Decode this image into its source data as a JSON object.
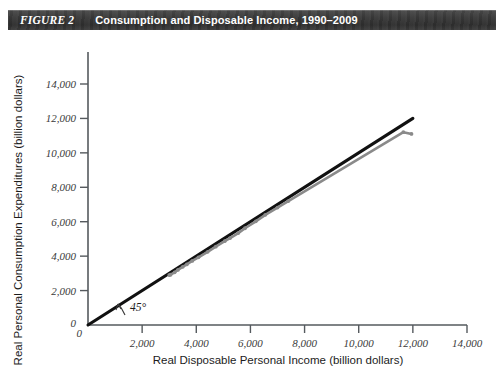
{
  "header": {
    "figure_label": "FIGURE 2",
    "title": "Consumption and Disposable Income, 1990–2009",
    "bar_color": "#343434",
    "text_color": "#ffffff"
  },
  "chart_data": {
    "type": "line",
    "title": "Consumption and Disposable Income, 1990–2009",
    "xlabel": "Real Disposable Personal Income (billion dollars)",
    "ylabel": "Real Personal Consumption Expenditures (billion dollars)",
    "xlim": [
      0,
      14000
    ],
    "ylim": [
      0,
      14000
    ],
    "xticks": [
      0,
      2000,
      4000,
      6000,
      8000,
      10000,
      12000,
      14000
    ],
    "yticks": [
      0,
      2000,
      4000,
      6000,
      8000,
      10000,
      12000,
      14000
    ],
    "xticklabels": [
      "0",
      "2,000",
      "4,000",
      "6,000",
      "8,000",
      "10,000",
      "12,000",
      "14,000"
    ],
    "yticklabels": [
      "0",
      "2,000",
      "4,000",
      "6,000",
      "8,000",
      "10,000",
      "12,000",
      "14,000"
    ],
    "grid": false,
    "legend": "none",
    "annotations": [
      {
        "name": "forty-five-degree-label",
        "text": "45°",
        "x": 1250,
        "y": 700
      }
    ],
    "series": [
      {
        "name": "45-degree reference line",
        "style": "solid-black",
        "color": "#111111",
        "x": [
          0,
          12000
        ],
        "y": [
          0,
          12000
        ],
        "markers": false
      },
      {
        "name": "Consumption vs. Disposable Income",
        "style": "solid-gray-with-markers",
        "color": "#8a8a8a",
        "markers": true,
        "years": [
          1990,
          1991,
          1992,
          1993,
          1994,
          1995,
          1996,
          1997,
          1998,
          1999,
          2000,
          2001,
          2002,
          2003,
          2004,
          2005,
          2006,
          2007,
          2008,
          2009
        ],
        "x": [
          3000,
          3050,
          3200,
          3320,
          3500,
          3650,
          3850,
          4080,
          4420,
          4720,
          5050,
          5250,
          5550,
          5800,
          6200,
          6550,
          7000,
          7400,
          11650,
          11950
        ],
        "y": [
          2900,
          2920,
          3060,
          3200,
          3380,
          3520,
          3720,
          3930,
          4250,
          4550,
          4870,
          5050,
          5340,
          5620,
          6020,
          6400,
          6820,
          7200,
          11200,
          11100
        ]
      }
    ]
  },
  "x_axis": {
    "label": "Real Disposable Personal Income (billion dollars)",
    "ticks": [
      "0",
      "2,000",
      "4,000",
      "6,000",
      "8,000",
      "10,000",
      "12,000",
      "14,000"
    ]
  },
  "y_axis": {
    "label": "Real Personal Consumption Expenditures (billion dollars)",
    "ticks": [
      "0",
      "2,000",
      "4,000",
      "6,000",
      "8,000",
      "10,000",
      "12,000",
      "14,000"
    ]
  },
  "annotation": {
    "angle_label": "45°"
  }
}
